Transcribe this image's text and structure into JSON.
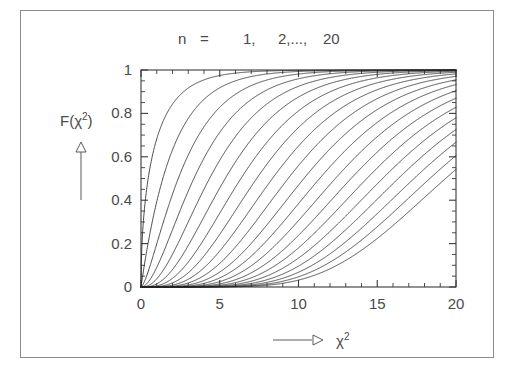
{
  "figure": {
    "background_color": "#ffffff",
    "frame_color": "#8c8c8c",
    "axis_color": "#3a3a3a",
    "curve_color": "#2b2b2b",
    "text_color": "#4a4a4a"
  },
  "labels": {
    "title": "n  =      1,    2,...,  20",
    "title_parts": {
      "variable": "n",
      "equals": "=",
      "first": "1,",
      "middle": "2,...,",
      "last": "20"
    },
    "ylabel_main": "F(",
    "ylabel_chi": "χ",
    "ylabel_exp": "2",
    "ylabel_close": ")",
    "xlabel_chi": "χ",
    "xlabel_exp": "2",
    "y_arrow": "up-arrow",
    "x_arrow": "right-arrow"
  },
  "chart_data": {
    "type": "line",
    "title": "n  =      1,    2,...,  20",
    "xlabel": "χ²",
    "ylabel": "F(χ²)",
    "xlim": [
      0,
      20
    ],
    "ylim": [
      0,
      1
    ],
    "grid": false,
    "legend": "none",
    "x_ticks": [
      0,
      5,
      10,
      15,
      20
    ],
    "x_tick_labels": [
      "0",
      "5",
      "10",
      "15",
      "20"
    ],
    "x_minor_tick_step": 1,
    "y_ticks": [
      0,
      0.2,
      0.4,
      0.6,
      0.8,
      1
    ],
    "y_tick_labels": [
      "0",
      "0.2",
      "0.4",
      "0.6",
      "0.8",
      "1"
    ],
    "y_minor_tick_step": 0.05,
    "function": "chi-squared cumulative distribution function",
    "x_sample_points": [
      0,
      0.5,
      1,
      2,
      3,
      4,
      5,
      6,
      7,
      8,
      9,
      10,
      11,
      12,
      13,
      14,
      15,
      16,
      17,
      18,
      19,
      20
    ],
    "series": [
      {
        "name": "n = 1",
        "dof": 1,
        "values": [
          0.0,
          0.52,
          0.683,
          0.843,
          0.917,
          0.954,
          0.975,
          0.986,
          0.992,
          0.995,
          0.997,
          0.998,
          0.999,
          0.999,
          1.0,
          1.0,
          1.0,
          1.0,
          1.0,
          1.0,
          1.0,
          1.0
        ]
      },
      {
        "name": "n = 2",
        "dof": 2,
        "values": [
          0.0,
          0.221,
          0.393,
          0.632,
          0.777,
          0.865,
          0.918,
          0.95,
          0.97,
          0.982,
          0.989,
          0.993,
          0.996,
          0.998,
          0.998,
          0.999,
          0.999,
          1.0,
          1.0,
          1.0,
          1.0,
          1.0
        ]
      },
      {
        "name": "n = 3",
        "dof": 3,
        "values": [
          0.0,
          0.081,
          0.199,
          0.428,
          0.608,
          0.739,
          0.828,
          0.888,
          0.928,
          0.954,
          0.971,
          0.981,
          0.988,
          0.993,
          0.995,
          0.997,
          0.998,
          0.999,
          0.999,
          1.0,
          1.0,
          1.0
        ]
      },
      {
        "name": "n = 4",
        "dof": 4,
        "values": [
          0.0,
          0.026,
          0.09,
          0.264,
          0.442,
          0.594,
          0.713,
          0.801,
          0.864,
          0.908,
          0.939,
          0.96,
          0.973,
          0.983,
          0.989,
          0.993,
          0.995,
          0.997,
          0.998,
          0.999,
          0.999,
          0.999
        ]
      },
      {
        "name": "n = 5",
        "dof": 5,
        "values": [
          0.0,
          0.008,
          0.037,
          0.151,
          0.3,
          0.451,
          0.584,
          0.694,
          0.779,
          0.844,
          0.891,
          0.925,
          0.949,
          0.965,
          0.977,
          0.984,
          0.99,
          0.993,
          0.996,
          0.997,
          0.998,
          0.999
        ]
      },
      {
        "name": "n = 6",
        "dof": 6,
        "values": [
          0.0,
          0.002,
          0.014,
          0.08,
          0.191,
          0.323,
          0.456,
          0.577,
          0.679,
          0.762,
          0.826,
          0.875,
          0.912,
          0.938,
          0.957,
          0.97,
          0.98,
          0.986,
          0.991,
          0.994,
          0.996,
          0.997
        ]
      },
      {
        "name": "n = 7",
        "dof": 7,
        "values": [
          0.0,
          0.001,
          0.005,
          0.04,
          0.114,
          0.22,
          0.34,
          0.46,
          0.571,
          0.667,
          0.747,
          0.811,
          0.861,
          0.9,
          0.928,
          0.949,
          0.964,
          0.975,
          0.983,
          0.988,
          0.992,
          0.995
        ]
      },
      {
        "name": "n = 8",
        "dof": 8,
        "values": [
          0.0,
          0.0,
          0.002,
          0.019,
          0.066,
          0.143,
          0.242,
          0.353,
          0.463,
          0.567,
          0.658,
          0.735,
          0.799,
          0.849,
          0.889,
          0.918,
          0.941,
          0.958,
          0.97,
          0.979,
          0.985,
          0.99
        ]
      },
      {
        "name": "n = 9",
        "dof": 9,
        "values": [
          0.0,
          0.0,
          0.001,
          0.009,
          0.036,
          0.089,
          0.166,
          0.26,
          0.363,
          0.466,
          0.563,
          0.65,
          0.725,
          0.787,
          0.839,
          0.88,
          0.912,
          0.937,
          0.955,
          0.969,
          0.979,
          0.985
        ]
      },
      {
        "name": "n = 10",
        "dof": 10,
        "values": [
          0.0,
          0.0,
          0.0,
          0.004,
          0.019,
          0.053,
          0.109,
          0.185,
          0.275,
          0.371,
          0.468,
          0.56,
          0.643,
          0.715,
          0.777,
          0.827,
          0.868,
          0.9,
          0.926,
          0.946,
          0.961,
          0.971
        ]
      },
      {
        "name": "n = 11",
        "dof": 11,
        "values": [
          0.0,
          0.0,
          0.0,
          0.002,
          0.01,
          0.031,
          0.069,
          0.126,
          0.199,
          0.285,
          0.378,
          0.47,
          0.557,
          0.637,
          0.707,
          0.767,
          0.818,
          0.859,
          0.892,
          0.919,
          0.94,
          0.956
        ]
      },
      {
        "name": "n = 12",
        "dof": 12,
        "values": [
          0.0,
          0.0,
          0.0,
          0.001,
          0.005,
          0.017,
          0.042,
          0.084,
          0.142,
          0.215,
          0.297,
          0.384,
          0.471,
          0.554,
          0.631,
          0.7,
          0.762,
          0.814,
          0.857,
          0.893,
          0.921,
          0.943
        ]
      },
      {
        "name": "n = 13",
        "dof": 13,
        "values": [
          0.0,
          0.0,
          0.0,
          0.0,
          0.003,
          0.01,
          0.025,
          0.054,
          0.099,
          0.159,
          0.231,
          0.311,
          0.393,
          0.476,
          0.555,
          0.629,
          0.696,
          0.755,
          0.806,
          0.849,
          0.885,
          0.914
        ]
      },
      {
        "name": "n = 14",
        "dof": 14,
        "values": [
          0.0,
          0.0,
          0.0,
          0.0,
          0.001,
          0.005,
          0.014,
          0.034,
          0.067,
          0.114,
          0.174,
          0.243,
          0.319,
          0.397,
          0.476,
          0.552,
          0.623,
          0.689,
          0.747,
          0.798,
          0.842,
          0.879
        ]
      },
      {
        "name": "n = 15",
        "dof": 15,
        "values": [
          0.0,
          0.0,
          0.0,
          0.0,
          0.001,
          0.003,
          0.008,
          0.02,
          0.043,
          0.079,
          0.127,
          0.187,
          0.254,
          0.327,
          0.402,
          0.476,
          0.547,
          0.615,
          0.677,
          0.734,
          0.784,
          0.827
        ]
      },
      {
        "name": "n = 16",
        "dof": 16,
        "values": [
          0.0,
          0.0,
          0.0,
          0.0,
          0.0,
          0.001,
          0.004,
          0.012,
          0.027,
          0.053,
          0.089,
          0.137,
          0.194,
          0.259,
          0.328,
          0.401,
          0.473,
          0.543,
          0.609,
          0.671,
          0.727,
          0.777
        ]
      },
      {
        "name": "n = 17",
        "dof": 17,
        "values": [
          0.0,
          0.0,
          0.0,
          0.0,
          0.0,
          0.001,
          0.002,
          0.007,
          0.017,
          0.035,
          0.061,
          0.098,
          0.145,
          0.2,
          0.262,
          0.329,
          0.398,
          0.468,
          0.536,
          0.601,
          0.662,
          0.717
        ]
      },
      {
        "name": "n = 18",
        "dof": 18,
        "values": [
          0.0,
          0.0,
          0.0,
          0.0,
          0.0,
          0.0,
          0.001,
          0.004,
          0.01,
          0.021,
          0.04,
          0.068,
          0.105,
          0.151,
          0.204,
          0.263,
          0.326,
          0.392,
          0.459,
          0.524,
          0.587,
          0.647
        ]
      },
      {
        "name": "n = 19",
        "dof": 19,
        "values": [
          0.0,
          0.0,
          0.0,
          0.0,
          0.0,
          0.0,
          0.001,
          0.002,
          0.006,
          0.013,
          0.026,
          0.046,
          0.074,
          0.111,
          0.155,
          0.206,
          0.263,
          0.324,
          0.387,
          0.451,
          0.514,
          0.575
        ]
      },
      {
        "name": "n = 20",
        "dof": 20,
        "values": [
          0.0,
          0.0,
          0.0,
          0.0,
          0.0,
          0.0,
          0.0,
          0.001,
          0.003,
          0.008,
          0.017,
          0.032,
          0.053,
          0.082,
          0.118,
          0.161,
          0.21,
          0.264,
          0.322,
          0.382,
          0.443,
          0.503
        ]
      }
    ]
  }
}
